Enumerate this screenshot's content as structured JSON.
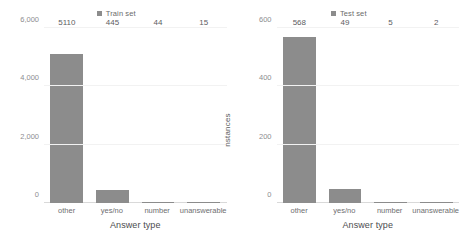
{
  "chart_data": [
    {
      "type": "bar",
      "panel": "left",
      "title": "",
      "legend": {
        "label": "Train set",
        "marker": "square",
        "position": "top-center"
      },
      "categories": [
        "other",
        "yes/no",
        "number",
        "unanswerable"
      ],
      "values": [
        5110,
        445,
        44,
        15
      ],
      "value_labels": [
        "5110",
        "445",
        "44",
        "15"
      ],
      "xlabel": "Answer type",
      "ylabel": "nstances",
      "ylim": [
        0,
        6000
      ],
      "yticks": [
        0,
        2000,
        4000,
        6000
      ],
      "ytick_labels": [
        "0",
        "2,000",
        "4,000",
        "6,000"
      ],
      "grid": true,
      "bar_color": "#8c8c8c"
    },
    {
      "type": "bar",
      "panel": "right",
      "title": "",
      "legend": {
        "label": "Test set",
        "marker": "square",
        "position": "top-center"
      },
      "categories": [
        "other",
        "yes/no",
        "number",
        "unanswerable"
      ],
      "values": [
        568,
        49,
        5,
        2
      ],
      "value_labels": [
        "568",
        "49",
        "5",
        "2"
      ],
      "xlabel": "Answer type",
      "ylabel": "nstances",
      "ylim": [
        0,
        600
      ],
      "yticks": [
        0,
        200,
        400,
        600
      ],
      "ytick_labels": [
        "0",
        "200",
        "400",
        "600"
      ],
      "grid": true,
      "bar_color": "#8c8c8c"
    }
  ]
}
